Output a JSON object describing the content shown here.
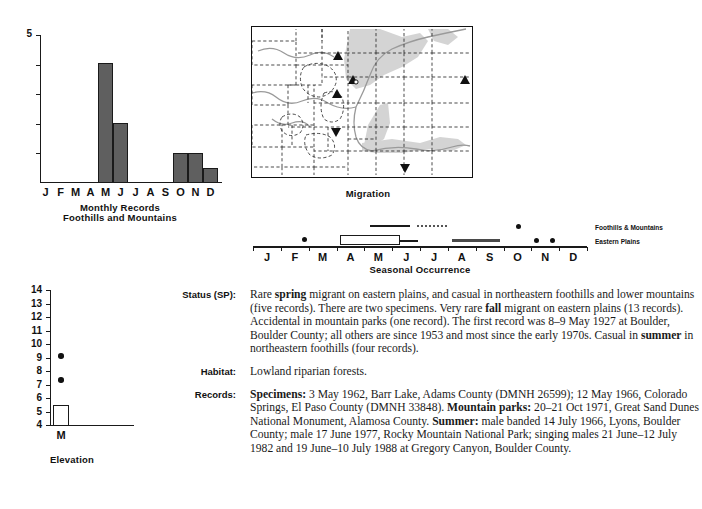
{
  "monthly_records": {
    "title_line1": "Monthly Records",
    "title_line2": "Foothills and Mountains",
    "y_top_label": "5",
    "months": [
      "J",
      "F",
      "M",
      "A",
      "M",
      "J",
      "J",
      "A",
      "S",
      "O",
      "N",
      "D"
    ]
  },
  "map": {
    "caption": "Migration",
    "marker_up": "triangle-up",
    "marker_down": "triangle-down"
  },
  "seasonal": {
    "title": "Seasonal Occurrence",
    "months": [
      "J",
      "F",
      "M",
      "A",
      "M",
      "J",
      "J",
      "A",
      "S",
      "O",
      "N",
      "D"
    ],
    "legend": [
      {
        "label": "Foothills & Mountains"
      },
      {
        "label": "Eastern Plains"
      }
    ]
  },
  "elevation": {
    "title": "Elevation",
    "x_label": "M",
    "y_ticks": [
      "14",
      "13",
      "12",
      "11",
      "10",
      "9",
      "8",
      "7",
      "6",
      "5",
      "4"
    ]
  },
  "account": {
    "rows": [
      {
        "label": "Status (SP):",
        "html": "Rare <b>spring</b> migrant on eastern plains, and casual in northeastern foothills and lower mountains (five records). There are two specimens. Very rare <b>fall</b> migrant on eastern plains (13 records). Accidental in mountain parks (one record). The first record was 8–9 May 1927 at Boulder, Boulder County; all others are since 1953 and most since the early 1970s. Casual in <b>summer</b> in northeastern foothills (four records)."
      },
      {
        "label": "Habitat:",
        "html": "Lowland riparian forests."
      },
      {
        "label": "Records:",
        "html": "<b>Specimens:</b> 3 May 1962, Barr Lake, Adams County (DMNH 26599); 12 May 1966, Colorado Springs, El Paso County (DMNH 33848). <b>Mountain parks:</b> 20–21 Oct 1971, Great Sand Dunes National Monument, Alamosa County. <b>Summer:</b> male banded 14 July 1966, Lyons, Boulder County; male 17 June 1977, Rocky Mountain National Park; singing males 21 June–12 July 1982 and 19 June–10 July 1988 at Gregory Canyon, Boulder County."
      }
    ]
  },
  "colors": {
    "bar_fill": "#5f5f5f",
    "ink": "#1a1a1a",
    "map_shade": "#cccccc",
    "map_river": "#9a9a9a"
  },
  "chart_data": [
    {
      "type": "bar",
      "title": "Monthly Records Foothills and Mountains",
      "categories": [
        "J",
        "F",
        "M",
        "A",
        "M",
        "J",
        "J",
        "A",
        "S",
        "O",
        "N",
        "D"
      ],
      "values": [
        0,
        0,
        0,
        0,
        4,
        2,
        0,
        0,
        0,
        1,
        1,
        0.5
      ],
      "xlabel": "",
      "ylabel": "",
      "ylim": [
        0,
        5
      ],
      "yticks": [
        0,
        1,
        2,
        3,
        4,
        5
      ],
      "ticklabels_shown": [
        "5"
      ],
      "grid": false,
      "legend": "none"
    },
    {
      "type": "bar",
      "title": "Elevation",
      "categories": [
        "M"
      ],
      "values": [
        5.5
      ],
      "value_base": 4,
      "points": [
        9.3,
        7.5
      ],
      "xlabel": "",
      "ylabel": "",
      "ylim": [
        4,
        14
      ],
      "yticks": [
        4,
        5,
        6,
        7,
        8,
        9,
        10,
        11,
        12,
        13,
        14
      ],
      "grid": false,
      "legend": "none"
    },
    {
      "type": "scatter",
      "title": "Seasonal Occurrence",
      "xlabel": "",
      "x": [
        "J",
        "F",
        "M",
        "A",
        "M",
        "J",
        "J",
        "A",
        "S",
        "O",
        "N",
        "D"
      ],
      "xlim": [
        0,
        12
      ],
      "series": [
        {
          "name": "Foothills & Mountains",
          "style": "solid-line",
          "intervals": [
            [
              4.2,
              5.6
            ]
          ],
          "points": [
            10.0
          ]
        },
        {
          "name": "Eastern Plains",
          "style": "dotted-line",
          "intervals": [
            [
              5.9,
              7.0
            ]
          ],
          "points": [
            10.6,
            11.1
          ]
        },
        {
          "name": "box-plot-spring",
          "style": "box",
          "box": [
            3.8,
            5.3
          ],
          "whisker": [
            5.3,
            5.9
          ],
          "outliers": [
            3.5
          ]
        },
        {
          "name": "autumn-bar",
          "style": "thick-line",
          "intervals": [
            [
              7.6,
              9.3
            ]
          ]
        }
      ],
      "grid": false,
      "legend": "right"
    }
  ]
}
